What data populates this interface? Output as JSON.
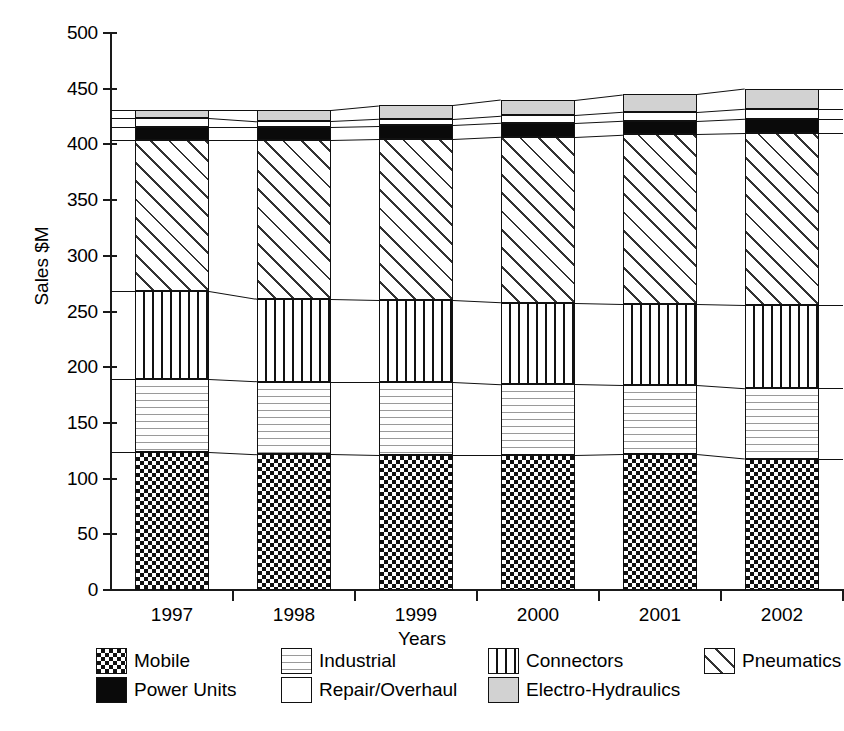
{
  "chart_data": {
    "type": "bar",
    "stacked": true,
    "title": "",
    "xlabel": "Years",
    "ylabel": "Sales $M",
    "ylim": [
      0,
      500
    ],
    "yticks": [
      0,
      50,
      100,
      150,
      200,
      250,
      300,
      350,
      400,
      450,
      500
    ],
    "ytick_labels": [
      "0",
      "50",
      "100",
      "150",
      "200",
      "250",
      "300",
      "350",
      "400",
      "450",
      "500"
    ],
    "grid": false,
    "legend_position": "bottom",
    "categories": [
      "1997",
      "1998",
      "1999",
      "2000",
      "2001",
      "2002"
    ],
    "series": [
      {
        "name": "Mobile",
        "pattern": "checkerboard",
        "color": "#111111",
        "values": [
          124,
          122,
          121,
          121,
          122,
          118
        ]
      },
      {
        "name": "Industrial",
        "pattern": "wavy-lines",
        "color": "#9a9a9a",
        "values": [
          65,
          65,
          66,
          64,
          62,
          63
        ]
      },
      {
        "name": "Connectors",
        "pattern": "vertical-lines",
        "color": "#111111",
        "values": [
          79,
          74,
          73,
          73,
          73,
          75
        ]
      },
      {
        "name": "Pneumatics",
        "pattern": "diagonal-hatch",
        "color": "#333333",
        "values": [
          136,
          143,
          145,
          149,
          152,
          154
        ]
      },
      {
        "name": "Power Units",
        "pattern": "solid-black",
        "color": "#0a0a0a",
        "values": [
          12,
          12,
          12,
          12,
          12,
          13
        ]
      },
      {
        "name": "Repair/Overhaul",
        "pattern": "solid-white",
        "color": "#ffffff",
        "values": [
          8,
          5,
          6,
          7,
          8,
          9
        ]
      },
      {
        "name": "Electro-Hydraulics",
        "pattern": "solid-gray",
        "color": "#d2d2d2",
        "values": [
          7,
          10,
          12,
          14,
          16,
          18
        ]
      }
    ],
    "totals": [
      431,
      431,
      435,
      441,
      447,
      450
    ]
  },
  "legend": {
    "entries": [
      {
        "label": "Mobile"
      },
      {
        "label": "Industrial"
      },
      {
        "label": "Connectors"
      },
      {
        "label": "Pneumatics"
      },
      {
        "label": "Power Units"
      },
      {
        "label": "Repair/Overhaul"
      },
      {
        "label": "Electro-Hydraulics"
      }
    ]
  },
  "axes": {
    "y_title": "Sales $M",
    "x_title": "Years"
  }
}
